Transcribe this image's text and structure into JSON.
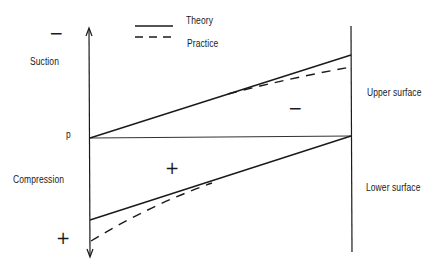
{
  "legend": {
    "items": [
      {
        "label": "Theory",
        "style": "solid"
      },
      {
        "label": "Practice",
        "style": "dashed"
      }
    ]
  },
  "axis": {
    "origin_label": "p",
    "top_label": "Suction",
    "bottom_label": "Compression",
    "top_sign": "−",
    "bottom_sign": "+"
  },
  "regions": {
    "upper_sign": "−",
    "lower_sign": "+"
  },
  "surfaces": {
    "upper": "Upper surface",
    "lower": "Lower surface"
  },
  "colors": {
    "ink": "#1a1a1a",
    "background": "#ffffff"
  }
}
